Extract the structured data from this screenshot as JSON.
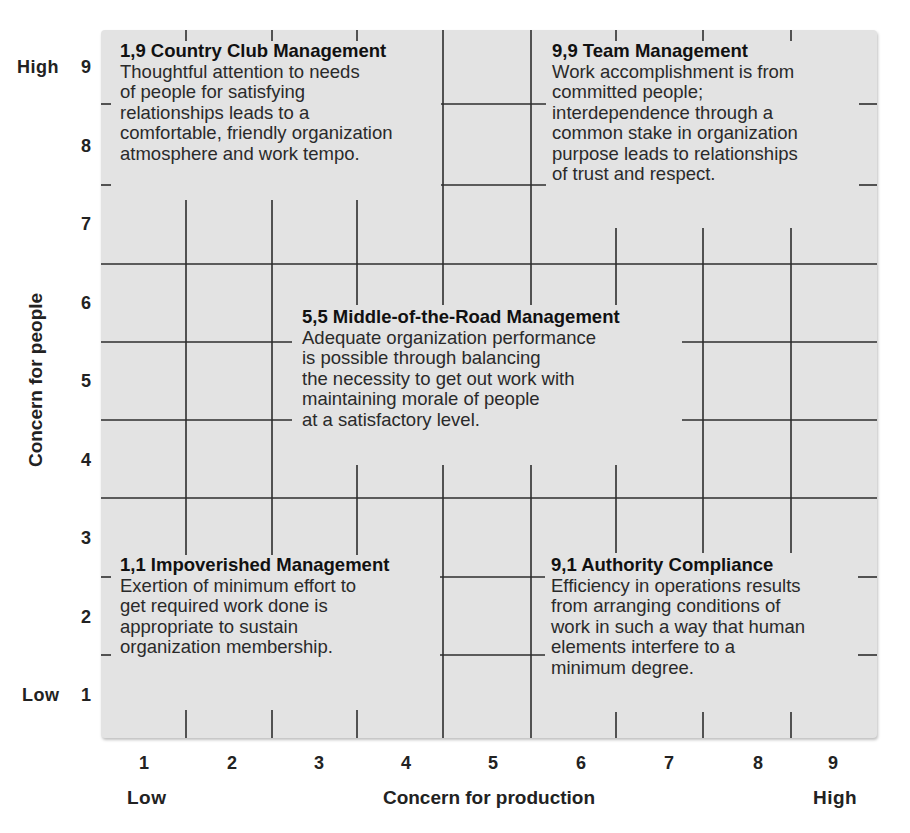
{
  "figure": {
    "y_axis": {
      "title": "Concern for people",
      "ticks": [
        "9",
        "8",
        "7",
        "6",
        "5",
        "4",
        "3",
        "2",
        "1"
      ],
      "high_label": "High",
      "low_label": "Low"
    },
    "x_axis": {
      "title": "Concern for production",
      "ticks": [
        "1",
        "2",
        "3",
        "4",
        "5",
        "6",
        "7",
        "8",
        "9"
      ],
      "low_label": "Low",
      "high_label": "High"
    },
    "colors": {
      "grid_fill": "#e3e3e3",
      "grid_line": "#2e2e2e",
      "text": "#1a1a1a"
    },
    "styles": [
      {
        "id": "country-club",
        "title": "1,9 Country Club Management",
        "lines": [
          "Thoughtful attention to needs",
          "of people for satisfying",
          "relationships leads to a",
          "comfortable, friendly organization",
          "atmosphere and work tempo."
        ]
      },
      {
        "id": "team",
        "title": "9,9 Team Management",
        "lines": [
          "Work accomplishment is from",
          "committed people;",
          "interdependence through a",
          "common stake in organization",
          "purpose leads to relationships",
          "of trust and respect."
        ]
      },
      {
        "id": "middle-of-the-road",
        "title": "5,5 Middle-of-the-Road Management",
        "lines": [
          "Adequate organization performance",
          "is possible through balancing",
          "the necessity to get out work with",
          "maintaining morale of people",
          "at a satisfactory level."
        ]
      },
      {
        "id": "impoverished",
        "title": "1,1 Impoverished Management",
        "lines": [
          "Exertion of minimum effort to",
          "get required work done is",
          "appropriate to sustain",
          "organization membership."
        ]
      },
      {
        "id": "authority-compliance",
        "title": "9,1 Authority Compliance",
        "lines": [
          "Efficiency in operations results",
          "from arranging conditions of",
          "work in such a way that human",
          "elements interfere to a",
          "minimum degree."
        ]
      }
    ]
  }
}
